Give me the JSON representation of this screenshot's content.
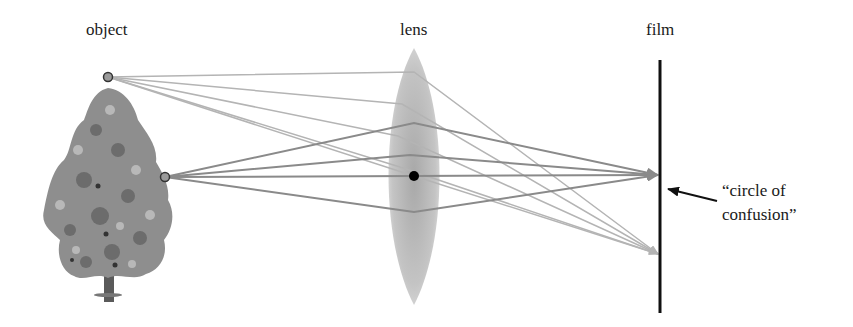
{
  "diagram": {
    "title_labels": {
      "object": "object",
      "lens": "lens",
      "film": "film"
    },
    "annotation": {
      "line1": "“circle of",
      "line2": "confusion”"
    },
    "elements": {
      "object": "tree with two marked points (top and middle)",
      "lens": "biconvex lens with optical center dot",
      "film": "vertical film plane"
    },
    "colors": {
      "upper_rays": "#b4b4b4",
      "lower_rays": "#8a8a8a",
      "film": "#111111",
      "lens_fill": "#c8c8c8",
      "point_fill": "#9a9a9a"
    }
  }
}
